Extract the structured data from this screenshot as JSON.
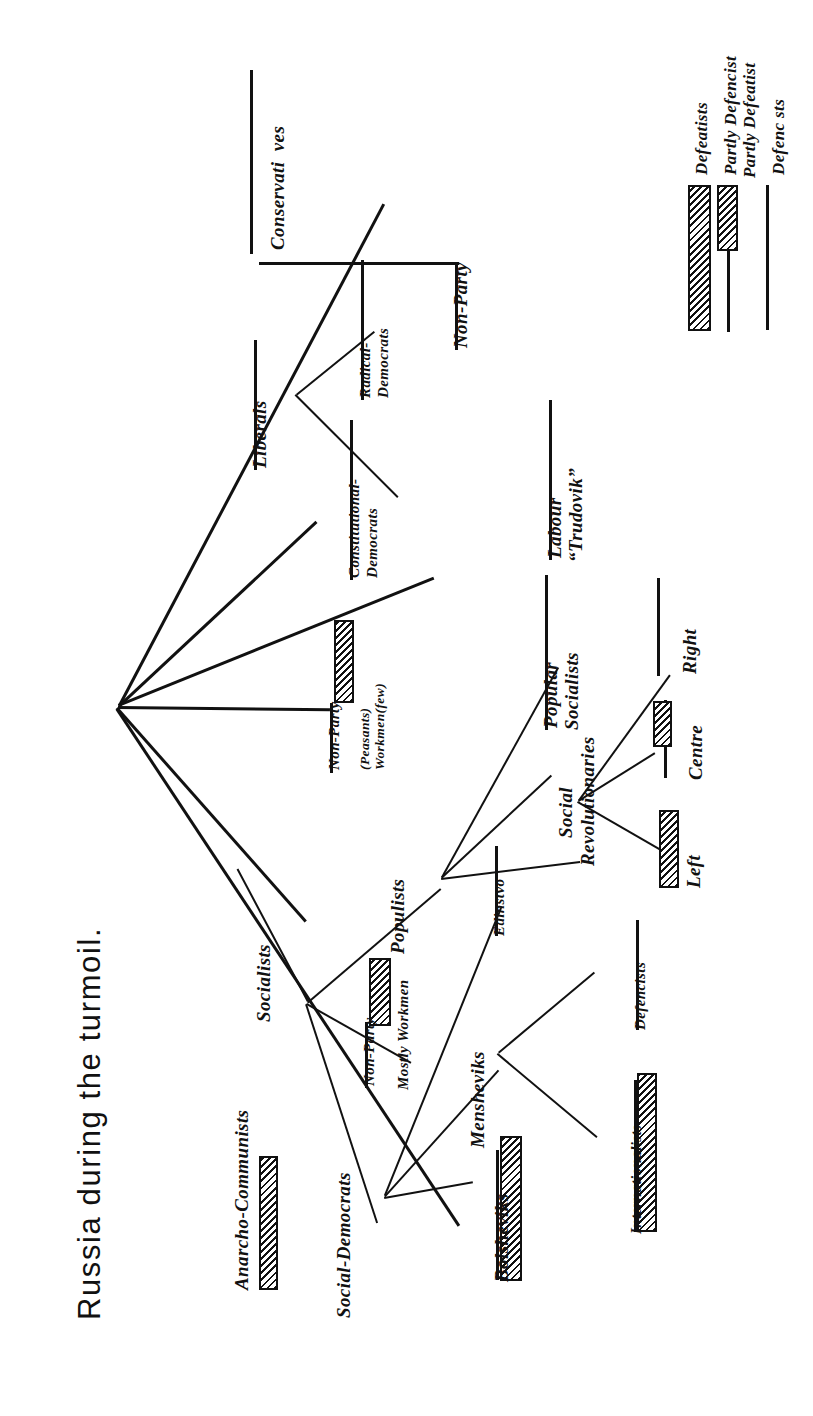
{
  "figure": {
    "title": "Russia during the turmoil.",
    "type": "tree-diagram",
    "orientation": "rotated-90-ccw",
    "background": "#ffffff",
    "ink_color": "#111111"
  },
  "legend": {
    "title": "",
    "items": [
      {
        "label": "Defenc sts",
        "swatch": "plain-line",
        "meaning": "Defencists"
      },
      {
        "label": "Partly Defencist",
        "label2": "Partly Defeatist",
        "swatch": "half-hatched-bar"
      },
      {
        "label": "Defeatists",
        "swatch": "hatched-bar"
      }
    ]
  },
  "tree": {
    "root_label": "",
    "branches": [
      {
        "id": "conservatives",
        "label": "Conservati  ves",
        "underline": true,
        "marker": "none",
        "children": []
      },
      {
        "id": "liberals",
        "label": "Liberals",
        "underline": true,
        "marker": "none",
        "children": [
          {
            "id": "radical-democrats",
            "label": "Radical-",
            "label2": "Democrats",
            "underline": true,
            "marker": "none"
          },
          {
            "id": "constitutional-democrats",
            "label": "Constitutional-",
            "label2": "Democrats",
            "underline": true,
            "marker": "none"
          }
        ]
      },
      {
        "id": "non-party-top",
        "label": "Non-Party",
        "underline": true,
        "marker": "none",
        "children": []
      },
      {
        "id": "non-party-peasants",
        "label": "Non-Party",
        "sub1": "(Peasants)",
        "sub2": "Workmen(few)",
        "underline": true,
        "marker": "half-hatched-bar",
        "children": []
      },
      {
        "id": "socialists",
        "label": "Socialists",
        "underline": false,
        "marker": "none",
        "children": [
          {
            "id": "anarcho-communists",
            "label": "Anarcho-Communists",
            "underline": false,
            "marker": "hatched-bar"
          },
          {
            "id": "non-party-workmen",
            "label": "Non-Party",
            "sub1": "Mostly Workmen",
            "underline": true,
            "marker": "half-hatched-bar"
          },
          {
            "id": "populists",
            "label": "Populists",
            "underline": false,
            "marker": "none",
            "children": [
              {
                "id": "labour-trudovik",
                "label": "Labour",
                "label2": "“Trudovik”",
                "underline": true,
                "marker": "none"
              },
              {
                "id": "popular-socialists",
                "label": "Popular",
                "label2": "Socialists",
                "underline": true,
                "marker": "none"
              },
              {
                "id": "social-revolutionaries",
                "label": "Social",
                "label2": "Revolutionaries",
                "underline": false,
                "marker": "none",
                "children": [
                  {
                    "id": "sr-right",
                    "label": "Right",
                    "underline": true,
                    "marker": "none"
                  },
                  {
                    "id": "sr-centre",
                    "label": "Centre",
                    "underline": true,
                    "marker": "half-hatched-bar"
                  },
                  {
                    "id": "sr-left",
                    "label": "Left",
                    "underline": false,
                    "marker": "hatched-bar"
                  }
                ]
              }
            ]
          },
          {
            "id": "social-democrats",
            "label": "Social-Democrats",
            "underline": false,
            "marker": "none",
            "children": [
              {
                "id": "bolsheviks",
                "label": "Bolsheviks",
                "underline": true,
                "marker": "hatched-bar"
              },
              {
                "id": "mensheviks",
                "label": "Mensheviks",
                "underline": false,
                "marker": "none",
                "children": [
                  {
                    "id": "defencists",
                    "label": "Defencists",
                    "underline": true,
                    "marker": "none"
                  },
                  {
                    "id": "internationalists",
                    "label": "Internationalists",
                    "underline": true,
                    "marker": "hatched-bar"
                  }
                ]
              },
              {
                "id": "edinstvo",
                "label": "Edinstvo",
                "underline": true,
                "marker": "none"
              }
            ]
          }
        ]
      }
    ]
  },
  "labels": {
    "conservatives": "Conservati  ves",
    "liberals": "Liberals",
    "radical_1": "Radical-",
    "radical_2": "Democrats",
    "kadet_1": "Constitutional-",
    "kadet_2": "Democrats",
    "non_party_top": "Non-Party",
    "non_party_peasants": "Non-Party",
    "peasants_sub1": "(Peasants)",
    "peasants_sub2": "Workmen(few)",
    "socialists": "Socialists",
    "anarcho": "Anarcho-Communists",
    "non_party_workmen": "Non-Party",
    "mostly_workmen": "Mostly Workmen",
    "populists": "Populists",
    "labour_1": "Labour",
    "labour_2": "“Trudovik”",
    "popular_1": "Popular",
    "popular_2": "Socialists",
    "sr_1": "Social",
    "sr_2": "Revolutionaries",
    "sr_right": "Right",
    "sr_centre": "Centre",
    "sr_left": "Left",
    "social_democrats": "Social-Democrats",
    "bolsheviks": "Bolsheviks",
    "mensheviks": "Mensheviks",
    "edinstvo": "Edinstvo",
    "defencists": "Defencists",
    "internationalists": "Internationalists",
    "legend_defencists": "Defenc sts",
    "legend_partly_1": "Partly Defencist",
    "legend_partly_2": "Partly Defeatist",
    "legend_defeatists": "Defeatists"
  }
}
